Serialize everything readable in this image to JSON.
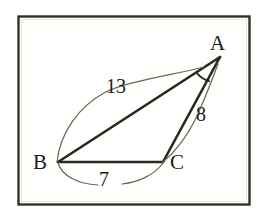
{
  "figure": {
    "kind": "geometry-diagram",
    "frame": {
      "stroke_color": "#33302c",
      "fill_color": "#fffffe",
      "x": 18,
      "y": 16,
      "width": 232,
      "height": 189
    },
    "stroke_color": "#2a2622",
    "leader_color": "#6d655c",
    "vertices": [
      {
        "id": "A",
        "label": "A",
        "x": 220,
        "y": 57
      },
      {
        "id": "B",
        "label": "B",
        "x": 58,
        "y": 162
      },
      {
        "id": "C",
        "label": "C",
        "x": 163,
        "y": 162
      }
    ],
    "sides": [
      {
        "id": "AB",
        "from": "B",
        "to": "A",
        "length_label": "13"
      },
      {
        "id": "AC",
        "from": "C",
        "to": "A",
        "length_label": "8"
      },
      {
        "id": "BC",
        "from": "B",
        "to": "C",
        "length_label": "7"
      }
    ],
    "measure_labels": {
      "ab": "13",
      "ac": "8",
      "bc": "7"
    },
    "vertex_labels": {
      "a": "A",
      "b": "B",
      "c": "C"
    },
    "angle_marks": [
      {
        "at": "A",
        "type": "single-arc",
        "radius": 26
      }
    ]
  }
}
